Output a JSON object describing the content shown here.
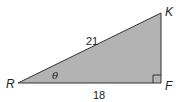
{
  "diagram": {
    "type": "right-triangle",
    "fill_color": "#b3b3b3",
    "stroke_color": "#333333",
    "vertices": {
      "R": {
        "label": "R"
      },
      "K": {
        "label": "K"
      },
      "F": {
        "label": "F"
      }
    },
    "sides": {
      "hypotenuse_RK": "21",
      "base_RF": "18"
    },
    "angle_label": "θ",
    "right_angle_at": "F"
  }
}
